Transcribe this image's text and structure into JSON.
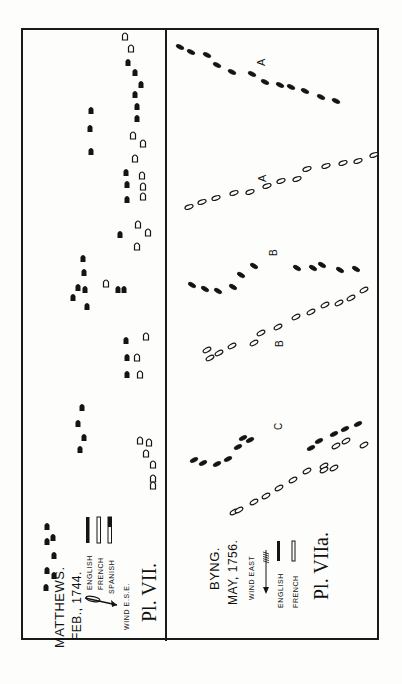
{
  "plates": {
    "left": {
      "title": "MATTHEWS.",
      "date": "FEB., 1744.",
      "plate_label": "Pl. VII.",
      "wind": "WIND E.S.E.",
      "legend": [
        {
          "label": "ENGLISH",
          "style": "solid"
        },
        {
          "label": "FRENCH",
          "style": "outline"
        },
        {
          "label": "SPANISH",
          "style": "half"
        }
      ]
    },
    "right": {
      "title": "BYNG.",
      "date": "MAY, 1756.",
      "plate_label": "Pl. VIIa.",
      "wind": "WIND EAST",
      "legend": [
        {
          "label": "ENGLISH",
          "style": "solid"
        },
        {
          "label": "FRENCH",
          "style": "outline"
        }
      ],
      "annotations": [
        "A",
        "A",
        "B",
        "B",
        "C"
      ]
    }
  },
  "colors": {
    "ink": "#141414",
    "paper": "#fdfdfb"
  },
  "ships": {
    "matthews": [
      [
        125,
        36,
        "o"
      ],
      [
        131,
        48,
        "o"
      ],
      [
        128,
        62,
        "s"
      ],
      [
        135,
        72,
        "s"
      ],
      [
        141,
        84,
        "s"
      ],
      [
        135,
        94,
        "s"
      ],
      [
        137,
        106,
        "s"
      ],
      [
        137,
        118,
        "s"
      ],
      [
        133,
        135,
        "o"
      ],
      [
        143,
        143,
        "o"
      ],
      [
        135,
        158,
        "o"
      ],
      [
        126,
        172,
        "s"
      ],
      [
        127,
        184,
        "s"
      ],
      [
        127,
        199,
        "s"
      ],
      [
        142,
        175,
        "o"
      ],
      [
        143,
        186,
        "o"
      ],
      [
        143,
        196,
        "o"
      ],
      [
        91,
        110,
        "s"
      ],
      [
        90,
        128,
        "s"
      ],
      [
        91,
        151,
        "s"
      ],
      [
        138,
        224,
        "o"
      ],
      [
        148,
        232,
        "o"
      ],
      [
        120,
        234,
        "s"
      ],
      [
        137,
        246,
        "o"
      ],
      [
        83,
        258,
        "s"
      ],
      [
        84,
        272,
        "s"
      ],
      [
        78,
        287,
        "s"
      ],
      [
        85,
        289,
        "s"
      ],
      [
        73,
        297,
        "s"
      ],
      [
        87,
        306,
        "s"
      ],
      [
        118,
        289,
        "s"
      ],
      [
        124,
        289,
        "s"
      ],
      [
        106,
        283,
        "o"
      ],
      [
        126,
        340,
        "s"
      ],
      [
        146,
        336,
        "o"
      ],
      [
        127,
        357,
        "s"
      ],
      [
        137,
        357,
        "o"
      ],
      [
        127,
        374,
        "s"
      ],
      [
        140,
        374,
        "o"
      ],
      [
        82,
        407,
        "s"
      ],
      [
        78,
        423,
        "s"
      ],
      [
        84,
        437,
        "s"
      ],
      [
        80,
        449,
        "s"
      ],
      [
        140,
        440,
        "o"
      ],
      [
        149,
        442,
        "o"
      ],
      [
        146,
        453,
        "o"
      ],
      [
        153,
        464,
        "o"
      ],
      [
        153,
        478,
        "o"
      ],
      [
        153,
        485,
        "o"
      ],
      [
        47,
        526,
        "s"
      ],
      [
        47,
        541,
        "s"
      ],
      [
        53,
        537,
        "s"
      ],
      [
        54,
        555,
        "s"
      ],
      [
        47,
        570,
        "s"
      ],
      [
        54,
        575,
        "s"
      ],
      [
        46,
        587,
        "s"
      ]
    ],
    "byng_english_top": [
      [
        180,
        47
      ],
      [
        191,
        52
      ],
      [
        207,
        55
      ],
      [
        217,
        65
      ],
      [
        232,
        72
      ],
      [
        252,
        74
      ],
      [
        265,
        82
      ],
      [
        280,
        85
      ],
      [
        291,
        87
      ],
      [
        305,
        91
      ],
      [
        321,
        97
      ],
      [
        336,
        101
      ]
    ],
    "byng_french_top": [
      [
        374,
        155
      ],
      [
        358,
        161
      ],
      [
        343,
        163
      ],
      [
        326,
        166
      ],
      [
        307,
        169
      ],
      [
        297,
        179
      ],
      [
        281,
        181
      ],
      [
        267,
        186
      ],
      [
        250,
        192
      ],
      [
        234,
        193
      ],
      [
        216,
        198
      ],
      [
        202,
        202
      ],
      [
        189,
        207
      ]
    ],
    "byng_english_mid": [
      [
        192,
        285
      ],
      [
        205,
        289
      ],
      [
        218,
        291
      ],
      [
        233,
        287
      ],
      [
        241,
        275
      ],
      [
        254,
        266
      ],
      [
        297,
        268
      ],
      [
        313,
        268
      ],
      [
        322,
        265
      ],
      [
        340,
        270
      ],
      [
        356,
        269
      ]
    ],
    "byng_french_mid": [
      [
        364,
        290
      ],
      [
        351,
        298
      ],
      [
        339,
        303
      ],
      [
        325,
        305
      ],
      [
        311,
        312
      ],
      [
        296,
        317
      ],
      [
        278,
        327
      ],
      [
        261,
        333
      ],
      [
        254,
        343
      ],
      [
        232,
        346
      ],
      [
        219,
        353
      ],
      [
        207,
        350
      ],
      [
        210,
        358
      ]
    ],
    "byng_english_low": [
      [
        194,
        460
      ],
      [
        203,
        463
      ],
      [
        217,
        464
      ],
      [
        228,
        459
      ],
      [
        238,
        447
      ],
      [
        243,
        438
      ],
      [
        250,
        440
      ],
      [
        311,
        448
      ],
      [
        319,
        441
      ],
      [
        334,
        434
      ],
      [
        345,
        429
      ],
      [
        358,
        424
      ]
    ],
    "byng_french_low": [
      [
        234,
        512
      ],
      [
        239,
        510
      ],
      [
        254,
        502
      ],
      [
        266,
        496
      ],
      [
        279,
        488
      ],
      [
        293,
        480
      ],
      [
        307,
        471
      ],
      [
        324,
        466
      ],
      [
        336,
        446
      ],
      [
        346,
        441
      ],
      [
        364,
        445
      ],
      [
        324,
        470
      ],
      [
        334,
        468
      ]
    ]
  }
}
